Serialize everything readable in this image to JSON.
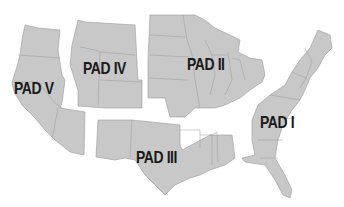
{
  "map": {
    "subject": "U.S. Petroleum Administration for Defense Districts",
    "fill_color": "#c8c8c8",
    "border_color": "#9a9a9a",
    "label_color": "#1a1a1a",
    "regions": [
      {
        "id": "pad-1",
        "label": "PAD I"
      },
      {
        "id": "pad-2",
        "label": "PAD II"
      },
      {
        "id": "pad-3",
        "label": "PAD III"
      },
      {
        "id": "pad-4",
        "label": "PAD IV"
      },
      {
        "id": "pad-5",
        "label": "PAD V"
      }
    ]
  }
}
